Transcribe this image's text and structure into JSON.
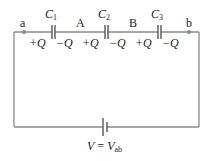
{
  "diagram": {
    "type": "series-capacitor-circuit",
    "wire_color": "#8a8a8a",
    "nodes": {
      "a": "a",
      "A": "A",
      "B": "B",
      "b": "b"
    },
    "capacitors": [
      {
        "name": "C",
        "sub": "1",
        "plus": "+Q",
        "minus": "−Q"
      },
      {
        "name": "C",
        "sub": "2",
        "plus": "+Q",
        "minus": "−Q"
      },
      {
        "name": "C",
        "sub": "3",
        "plus": "+Q",
        "minus": "−Q"
      }
    ],
    "battery": {
      "label_v": "V",
      "label_eq": " = ",
      "label_vab": "V",
      "label_vab_sub": "ab"
    }
  }
}
